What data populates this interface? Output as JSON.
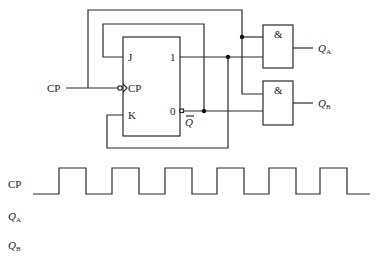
{
  "circuit": {
    "clock_input_label": "CP",
    "flipflop": {
      "type": "JK",
      "pins": {
        "j": "J",
        "k": "K",
        "clk": "CP",
        "q_out": "1",
        "qbar_out": "0",
        "qbar_label": "Q"
      }
    },
    "gates": [
      {
        "symbol": "&",
        "output": "Q",
        "output_sub": "A"
      },
      {
        "symbol": "&",
        "output": "Q",
        "output_sub": "B"
      }
    ]
  },
  "waveforms": {
    "rows": [
      {
        "label": "CP",
        "sub": ""
      },
      {
        "label": "Q",
        "sub": "A"
      },
      {
        "label": "Q",
        "sub": "B"
      }
    ],
    "cp_pulses": 6,
    "cp_edges_x": [
      33,
      59,
      86,
      112,
      139,
      165,
      192,
      217,
      244,
      269,
      296,
      320,
      347,
      370
    ]
  }
}
